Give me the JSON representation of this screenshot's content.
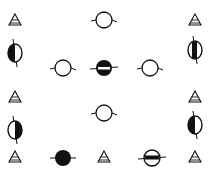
{
  "diagram": {
    "width": 212,
    "height": 169,
    "background": "#ffffff",
    "ink": "#111111",
    "symbols": [
      {
        "id": "tri-1",
        "type": "triangle",
        "x": 15,
        "y": 20
      },
      {
        "id": "circle-open-1",
        "type": "circle-open-h",
        "x": 104,
        "y": 20
      },
      {
        "id": "tri-2",
        "type": "triangle",
        "x": 195,
        "y": 20
      },
      {
        "id": "circle-half-v-1",
        "type": "circle-half-vertical",
        "x": 15,
        "y": 53,
        "fill_side": "left"
      },
      {
        "id": "circle-open-2",
        "type": "circle-open-h",
        "x": 63,
        "y": 68
      },
      {
        "id": "circle-half-h-1",
        "type": "circle-half-horizontal",
        "x": 104,
        "y": 68
      },
      {
        "id": "circle-open-3",
        "type": "circle-open-h",
        "x": 150,
        "y": 68
      },
      {
        "id": "circle-half-v-2",
        "type": "circle-half-vertical",
        "x": 195,
        "y": 50,
        "fill_side": "center"
      },
      {
        "id": "tri-3",
        "type": "triangle",
        "x": 15,
        "y": 97
      },
      {
        "id": "circle-open-4",
        "type": "circle-open-h",
        "x": 104,
        "y": 113
      },
      {
        "id": "tri-4",
        "type": "triangle",
        "x": 195,
        "y": 97
      },
      {
        "id": "circle-half-v-3",
        "type": "circle-half-vertical",
        "x": 15,
        "y": 130,
        "fill_side": "right"
      },
      {
        "id": "circle-half-v-4",
        "type": "circle-half-vertical",
        "x": 195,
        "y": 125,
        "fill_side": "left"
      },
      {
        "id": "tri-5",
        "type": "triangle",
        "x": 15,
        "y": 157
      },
      {
        "id": "circle-filled-1",
        "type": "circle-filled",
        "x": 63,
        "y": 158
      },
      {
        "id": "tri-6",
        "type": "triangle",
        "x": 104,
        "y": 157
      },
      {
        "id": "circle-band-1",
        "type": "circle-band-horizontal",
        "x": 152,
        "y": 158
      },
      {
        "id": "tri-7",
        "type": "triangle",
        "x": 195,
        "y": 157
      }
    ]
  }
}
